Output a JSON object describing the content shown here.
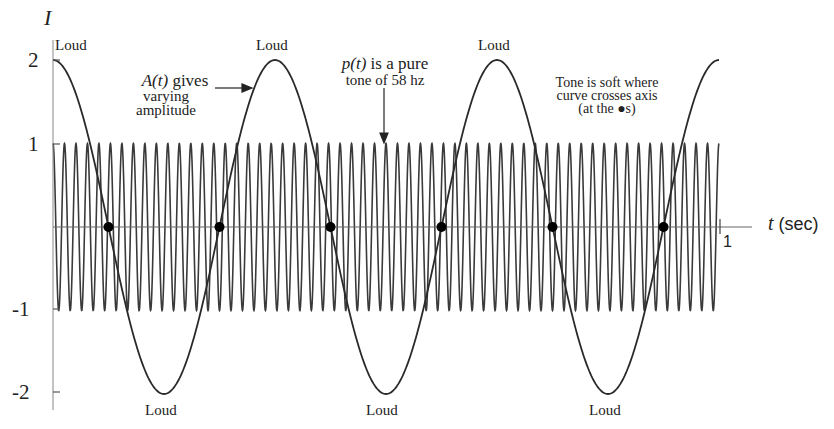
{
  "chart_data": {
    "type": "line",
    "title": "",
    "xlabel": "t (sec)",
    "ylabel": "I",
    "xlim": [
      0,
      1
    ],
    "ylim": [
      -2,
      2
    ],
    "yticks": [
      "2",
      "1",
      "-1",
      "-2"
    ],
    "xticks": [
      "1"
    ],
    "grid": false,
    "series": [
      {
        "name": "A(t)",
        "formula": "2*cos(6*pi*t)",
        "description": "varying amplitude envelope, 3 cycles over 1 sec"
      },
      {
        "name": "p(t)",
        "formula": "cos(2*pi*58*t)",
        "description": "pure tone of 58 hz, amplitude 1"
      }
    ],
    "zero_crossings_t": [
      0.0833,
      0.25,
      0.4167,
      0.5833,
      0.75,
      0.9167
    ],
    "annotations": {
      "loud_top": [
        "Loud",
        "Loud",
        "Loud"
      ],
      "loud_bottom": [
        "Loud",
        "Loud",
        "Loud"
      ],
      "a_label": "A(t)",
      "a_text1": "gives",
      "a_text2": "varying",
      "a_text3": "amplitude",
      "p_label": "p(t)",
      "p_text1": "is a pure",
      "p_text2": "tone of 58 hz",
      "soft1": "Tone is soft where",
      "soft2": "curve crosses axis",
      "soft3": "(at the ●s)"
    }
  }
}
